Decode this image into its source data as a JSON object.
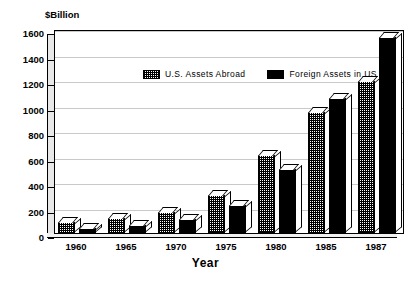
{
  "chart_data": {
    "type": "bar",
    "title": "",
    "unit_label": "$Billion",
    "xlabel": "Year",
    "ylabel": "",
    "categories": [
      "1960",
      "1965",
      "1970",
      "1975",
      "1980",
      "1985",
      "1987"
    ],
    "series": [
      {
        "name": "U.S. Assets Abroad",
        "values": [
          85,
          120,
          165,
          295,
          610,
          950,
          1190
        ],
        "pattern": "hatched",
        "color": "#000000"
      },
      {
        "name": "Foreign Assets in US",
        "values": [
          40,
          60,
          107,
          220,
          500,
          1060,
          1540
        ],
        "pattern": "solid",
        "color": "#000000"
      }
    ],
    "ylim": [
      0,
      1600
    ],
    "yticks": [
      0,
      200,
      400,
      600,
      800,
      1000,
      1200,
      1400,
      1600
    ],
    "ytick_labels": [
      "0",
      "200",
      "400",
      "600",
      "800",
      "1000",
      "1200",
      "1400",
      "1600"
    ],
    "grid": true,
    "legend_position": "top-center",
    "style": "3d-bars"
  },
  "legend": {
    "items": [
      {
        "label": "U.S. Assets Abroad",
        "swatch": "hatched-swatch"
      },
      {
        "label": "Foreign Assets in US",
        "swatch": "solid-black-swatch"
      }
    ]
  }
}
